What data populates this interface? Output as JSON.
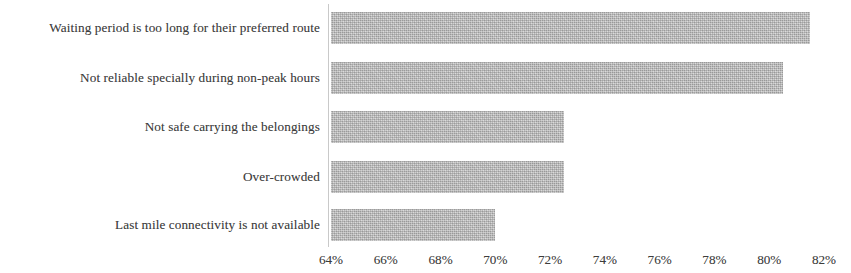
{
  "chart_data": {
    "type": "bar",
    "orientation": "horizontal",
    "title": "",
    "subtitle": "",
    "xlabel": "",
    "ylabel": "",
    "categories": [
      "Waiting period is too long for their preferred route",
      "Not reliable specially during non-peak hours",
      "Not safe carrying the belongings",
      "Over-crowded",
      "Last mile connectivity is not available"
    ],
    "values": [
      81.5,
      80.5,
      72.5,
      72.5,
      70.0
    ],
    "value_unit": "%",
    "xlim": [
      64,
      82
    ],
    "xticks": [
      64,
      66,
      68,
      70,
      72,
      74,
      76,
      78,
      80,
      82
    ],
    "xtick_labels": [
      "64%",
      "66%",
      "68%",
      "70%",
      "72%",
      "74%",
      "76%",
      "78%",
      "80%",
      "82%"
    ],
    "grid": false,
    "legend": false,
    "legend_position": "none",
    "bar_color": "#a9a9a9",
    "axis_color": "#c9c9c9",
    "text_color": "#3d3d3d"
  }
}
